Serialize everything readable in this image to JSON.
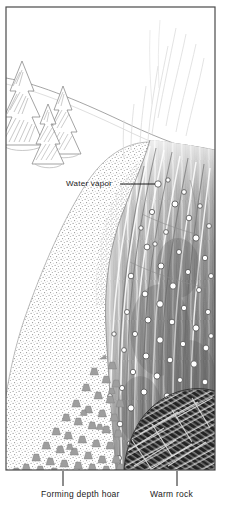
{
  "figure": {
    "type": "scientific-illustration",
    "frame": {
      "border_color": "#4a4a4a",
      "background": "#ffffff"
    }
  },
  "labels": {
    "water_vapor": "Water vapor",
    "forming_depth_hoar": "Forming depth hoar",
    "warm_rock": "Warm rock"
  },
  "leaders": {
    "water_vapor": {
      "from_x": 120,
      "to_x": 158,
      "y": 184,
      "marker": "circle"
    },
    "forming_depth_hoar": {
      "x": 63,
      "from_y": 470,
      "to_y": 486
    },
    "warm_rock": {
      "x": 177,
      "from_y": 470,
      "to_y": 486
    }
  },
  "scene": {
    "sky": {
      "fill": "#ffffff"
    },
    "snow_surface_line": "gentle curve from upper-left down to right edge",
    "trees": [
      {
        "name": "conifer-left",
        "x": 22,
        "y": 68,
        "scale": 1.0
      },
      {
        "name": "conifer-mid",
        "x": 50,
        "y": 100,
        "scale": 0.72
      },
      {
        "name": "conifer-right",
        "x": 63,
        "y": 88,
        "scale": 0.88
      }
    ],
    "vapor_wisps": {
      "count": 9,
      "color": "#dcdcdc",
      "region": "upper right"
    },
    "snow_stipple": {
      "name": "granular-snow",
      "dot_color": "#8a8a8a",
      "density": "fine stipple"
    },
    "vapor_column": {
      "name": "rising-vapor-column",
      "tone": "#9a9a9a",
      "bubbles": {
        "count": 64,
        "fill": "#ffffff",
        "stroke": "#4d4d4d",
        "radius_px": [
          2.2,
          3.8
        ]
      }
    },
    "depth_hoar_crystals": {
      "count": 58,
      "glyph": "cup-shaped-crystal",
      "fill": "#9e9e9e"
    },
    "warm_rock": {
      "name": "rock-mass",
      "hatch": "crosshatched elongated blocks",
      "fill": "#111111"
    }
  },
  "colors": {
    "ink": "#1a1a1a",
    "frame": "#4a4a4a",
    "snow_mid": "#b9b9b9",
    "snow_dark": "#7e7e7e",
    "rock": "#101010",
    "wisp": "#dcdcdc"
  }
}
